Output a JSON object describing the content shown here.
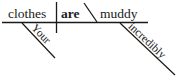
{
  "diagram": {
    "type": "reed-kellogg-sentence-diagram",
    "sentence": "Your clothes are incredibly muddy.",
    "baseline": {
      "color": "#1a1a1a"
    },
    "words": {
      "subject": "clothes",
      "verb": "are",
      "predicate_adjective": "muddy",
      "subject_modifier": "Your",
      "adjective_modifier": "incredibly"
    },
    "line_color": "#1a1a1a",
    "background_color": "#ffffff"
  }
}
